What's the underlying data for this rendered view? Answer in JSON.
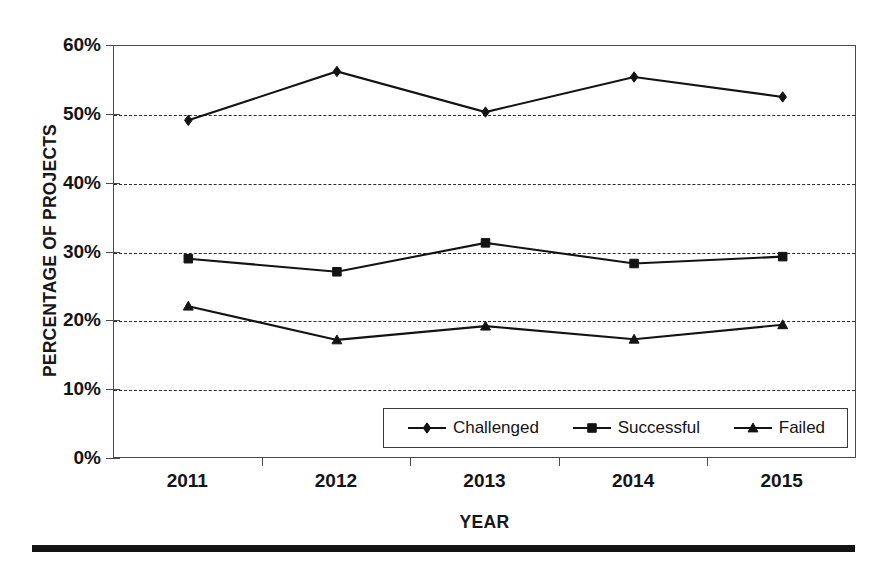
{
  "chart_data": {
    "type": "line",
    "title": "",
    "xlabel": "YEAR",
    "ylabel": "PERCENTAGE OF PROJECTS",
    "categories": [
      "2011",
      "2012",
      "2013",
      "2014",
      "2015"
    ],
    "x": [
      2011,
      2012,
      2013,
      2014,
      2015
    ],
    "ylim": [
      0,
      60
    ],
    "ytick_labels": [
      "0%",
      "10%",
      "20%",
      "30%",
      "40%",
      "50%",
      "60%"
    ],
    "ytick_values": [
      0,
      10,
      20,
      30,
      40,
      50,
      60
    ],
    "grid": "horizontal-dashed",
    "legend_position": "inside-bottom-right",
    "series": [
      {
        "name": "Challenged",
        "marker": "diamond",
        "color": "#131313",
        "values": [
          49.2,
          56.3,
          50.4,
          55.5,
          52.6
        ]
      },
      {
        "name": "Successful",
        "marker": "square",
        "color": "#131313",
        "values": [
          29.1,
          27.2,
          31.4,
          28.4,
          29.4
        ]
      },
      {
        "name": "Failed",
        "marker": "triangle",
        "color": "#131313",
        "values": [
          22.2,
          17.3,
          19.3,
          17.4,
          19.5
        ]
      }
    ]
  },
  "legend": {
    "entries": [
      {
        "label": "Challenged",
        "marker": "diamond"
      },
      {
        "label": "Successful",
        "marker": "square"
      },
      {
        "label": "Failed",
        "marker": "triangle"
      }
    ]
  },
  "axes": {
    "y_title": "PERCENTAGE OF PROJECTS",
    "x_title": "YEAR"
  }
}
